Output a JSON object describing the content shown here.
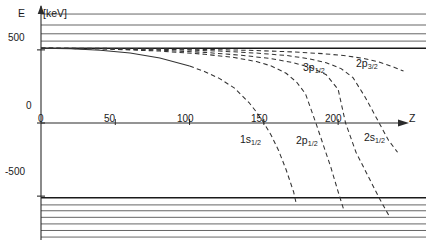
{
  "chart_data": {
    "type": "line",
    "title": "",
    "xlabel": "Z",
    "ylabel": "E",
    "yunit": "[keV]",
    "xlim": [
      0,
      245
    ],
    "ylim": [
      -800,
      800
    ],
    "xticks": [
      0,
      50,
      100,
      150,
      200
    ],
    "yticks": [
      500,
      0,
      -500
    ],
    "grid": false,
    "legend": "inline-annotations",
    "continuum": {
      "upper_label": "",
      "lower_label": "",
      "upper_lines_y": [
        511,
        560,
        610,
        670,
        745
      ],
      "lower_lines_y": [
        -511,
        -560,
        -600,
        -645,
        -690,
        -735,
        -780
      ]
    },
    "series": [
      {
        "name": "1s1/2",
        "label": "1s",
        "sub": "1/2",
        "style": "solid-then-dashed",
        "zero_crossing_z": 150,
        "x": [
          0,
          20,
          40,
          60,
          80,
          100,
          110,
          120,
          130,
          140,
          145,
          150,
          155,
          160,
          165,
          170,
          172
        ],
        "y": [
          511,
          508,
          498,
          478,
          444,
          390,
          352,
          305,
          240,
          140,
          75,
          0,
          -85,
          -190,
          -320,
          -470,
          -560
        ]
      },
      {
        "name": "2p1/2",
        "label": "2p",
        "sub": "1/2",
        "style": "dashed",
        "zero_crossing_z": 185,
        "x": [
          0,
          40,
          80,
          110,
          130,
          145,
          155,
          165,
          172,
          178,
          185,
          190,
          195,
          200,
          204
        ],
        "y": [
          511,
          507,
          492,
          470,
          448,
          420,
          390,
          340,
          280,
          200,
          0,
          -150,
          -300,
          -470,
          -600
        ]
      },
      {
        "name": "2s1/2",
        "label": "2s",
        "sub": "1/2",
        "style": "dashed",
        "zero_crossing_z": 205,
        "x": [
          0,
          40,
          80,
          110,
          135,
          155,
          170,
          182,
          192,
          200,
          205,
          212,
          220,
          228,
          234
        ],
        "y": [
          511,
          508,
          498,
          483,
          463,
          440,
          412,
          378,
          330,
          230,
          0,
          -200,
          -360,
          -520,
          -630
        ]
      },
      {
        "name": "3p1/2",
        "label": "3p",
        "sub": "1/2",
        "style": "dashed",
        "zero_crossing_z": 218,
        "x": [
          0,
          50,
          90,
          120,
          145,
          165,
          180,
          192,
          202,
          210,
          218,
          226,
          234,
          240
        ],
        "y": [
          511,
          509,
          502,
          492,
          478,
          462,
          440,
          412,
          372,
          310,
          180,
          30,
          -120,
          -200
        ]
      },
      {
        "name": "2p3/2",
        "label": "2p",
        "sub": "3/2",
        "style": "dashed",
        "zero_crossing_z": 240,
        "x": [
          0,
          50,
          100,
          140,
          170,
          190,
          205,
          218,
          228,
          238,
          244
        ],
        "y": [
          511,
          510,
          505,
          497,
          486,
          474,
          460,
          440,
          415,
          380,
          355
        ]
      }
    ],
    "annotations": [
      {
        "text": "3p",
        "sub": "1/2",
        "x": 193,
        "y": 370
      },
      {
        "text": "2p",
        "sub": "3/2",
        "x": 222,
        "y": 385
      },
      {
        "text": "1s",
        "sub": "1/2",
        "x": 152,
        "y": -218
      },
      {
        "text": "2p",
        "sub": "1/2",
        "x": 186,
        "y": -228
      },
      {
        "text": "2s",
        "sub": "1/2",
        "x": 228,
        "y": -218
      }
    ]
  },
  "axes": {
    "y_symbol": "E",
    "y_unit": "[keV]",
    "x_symbol": "Z",
    "ytick_500": "500",
    "ytick_0": "0",
    "ytick_neg500": "-500",
    "xtick_0": "0",
    "xtick_50": "50",
    "xtick_100": "100",
    "xtick_150": "150",
    "xtick_200": "200"
  },
  "labels": {
    "c3p12_base": "3p",
    "c3p12_sub": "1/2",
    "c2p32_base": "2p",
    "c2p32_sub": "3/2",
    "c1s12_base": "1s",
    "c1s12_sub": "1/2",
    "c2p12_base": "2p",
    "c2p12_sub": "1/2",
    "c2s12_base": "2s",
    "c2s12_sub": "1/2"
  },
  "colors": {
    "ink": "#1a1a1a",
    "axis": "#2b2b2b",
    "continuum": "#4a4a4a",
    "curve": "#333333",
    "background": "#ffffff"
  }
}
